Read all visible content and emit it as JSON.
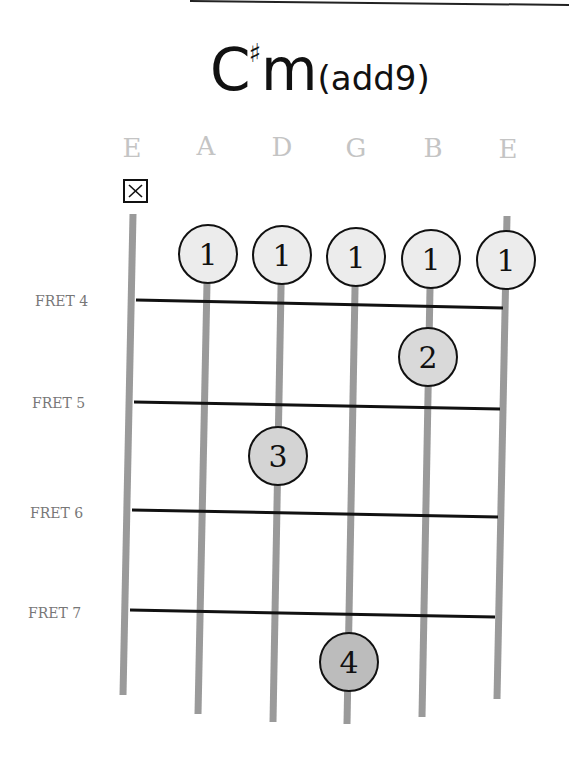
{
  "chord": {
    "root": "C",
    "accidental": "♯",
    "quality": "m",
    "extension": "(add9)",
    "full_name": "C#m(add9)"
  },
  "strings": [
    {
      "label": "E",
      "muted": true
    },
    {
      "label": "A",
      "muted": false
    },
    {
      "label": "D",
      "muted": false
    },
    {
      "label": "G",
      "muted": false
    },
    {
      "label": "B",
      "muted": false
    },
    {
      "label": "E",
      "muted": false
    }
  ],
  "muted_symbol": "✕",
  "frets": [
    {
      "label": "FRET 4"
    },
    {
      "label": "FRET 5"
    },
    {
      "label": "FRET 6"
    },
    {
      "label": "FRET 7"
    }
  ],
  "fingers": [
    {
      "finger": "1",
      "string": 2,
      "fret": 4
    },
    {
      "finger": "1",
      "string": 3,
      "fret": 4
    },
    {
      "finger": "1",
      "string": 4,
      "fret": 4
    },
    {
      "finger": "1",
      "string": 5,
      "fret": 4
    },
    {
      "finger": "1",
      "string": 6,
      "fret": 4
    },
    {
      "finger": "2",
      "string": 5,
      "fret": 5
    },
    {
      "finger": "3",
      "string": 3,
      "fret": 6
    },
    {
      "finger": "4",
      "string": 4,
      "fret": 7
    }
  ],
  "colors": {
    "string": "#9a9a9a",
    "fret_line": "#111111",
    "finger_1_fill": "#ececec",
    "finger_2_fill": "#d9d9d9",
    "finger_3_fill": "#d4d4d4",
    "finger_4_fill": "#bcbcbc",
    "string_label": "#c4c4c4",
    "fret_label": "#777777"
  }
}
